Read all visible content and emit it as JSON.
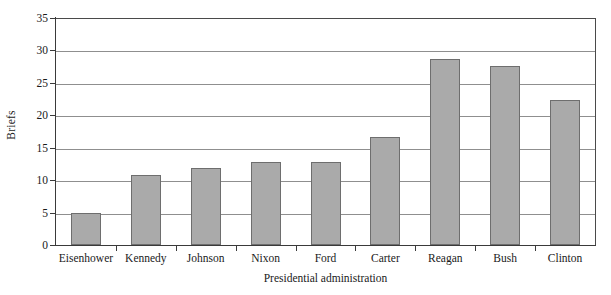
{
  "chart_data": {
    "type": "bar",
    "title": "",
    "xlabel": "Presidential administration",
    "ylabel": "Briefs",
    "categories": [
      "Eisenhower",
      "Kennedy",
      "Johnson",
      "Nixon",
      "Ford",
      "Carter",
      "Reagan",
      "Bush",
      "Clinton"
    ],
    "values": [
      5.0,
      10.8,
      11.8,
      12.8,
      12.8,
      16.7,
      28.7,
      27.6,
      22.4
    ],
    "ylim": [
      0,
      35
    ],
    "yticks": [
      0,
      5,
      10,
      15,
      20,
      25,
      30,
      35
    ],
    "ytick_labels": [
      "0",
      "5",
      "10",
      "15",
      "20",
      "25",
      "30",
      "35"
    ],
    "grid": "horizontal",
    "legend": "none",
    "bar_color": "#aaaaaa",
    "bar_edge_color": "#6e6e6e",
    "gridline_color": "#8f8f8f",
    "axis_color": "#3a3a3a",
    "background": "#ffffff"
  }
}
